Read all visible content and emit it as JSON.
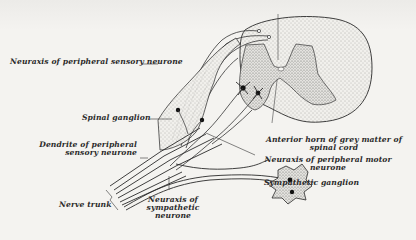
{
  "figure": {
    "colors": {
      "background": "#f4f3f0",
      "ink": "#2a2a2a",
      "stipple": "#6a6a6a"
    },
    "labels": {
      "neuraxis_sensory": "Neuraxis of peripheral sensory neurone",
      "spinal_ganglion": "Spinal ganglion",
      "dendrite_line1": "Dendrite of peripheral",
      "dendrite_line2": "sensory neurone",
      "anterior_horn_line1": "Anterior horn of grey matter of",
      "anterior_horn_line2": "spinal cord",
      "neuraxis_motor_line1": "Neuraxis of peripheral motor",
      "neuraxis_motor_line2": "neurone",
      "sympathetic_ganglion": "Sympathetic ganglion",
      "nerve_trunk": "Nerve trunk",
      "neuraxis_symp_line1": "Neuraxis of",
      "neuraxis_symp_line2": "sympathetic",
      "neuraxis_symp_line3": "neurone"
    }
  }
}
